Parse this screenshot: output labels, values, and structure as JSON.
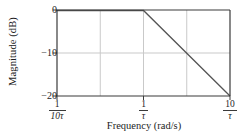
{
  "chart_data": {
    "type": "line",
    "title": "",
    "xlabel": "Frequency (rad/s)",
    "ylabel": "Magnitude (dB)",
    "xscale": "log",
    "x_tick_labels": [
      "1/(10τ)",
      "1/τ",
      "10/τ"
    ],
    "x_ticks_numerator": [
      "1",
      "1",
      "10"
    ],
    "x_ticks_denominator": [
      "10τ",
      "τ",
      "τ"
    ],
    "y_tick_labels": [
      "0",
      "−10",
      "−20"
    ],
    "y_ticks": [
      0,
      -10,
      -20
    ],
    "ylim": [
      -20,
      0
    ],
    "xlim_decades": [
      -1,
      1
    ],
    "grid": true,
    "gridlines_x_decades": [
      -1,
      -0.5,
      0,
      0.5,
      1
    ],
    "gridlines_y": [
      0,
      -10,
      -20
    ],
    "legend": "none",
    "series": [
      {
        "name": "First-order low-pass asymptotic magnitude",
        "x_decades": [
          -1,
          0,
          1
        ],
        "values": [
          0,
          0,
          -20
        ],
        "slope_after_corner_db_per_decade": -20,
        "corner_frequency_label": "1/τ",
        "color": "#4a4a4a"
      }
    ],
    "annotations": []
  },
  "axes": {
    "frame_color": "#3a3a3a",
    "grid_color": "#c9c9c9",
    "background": "#ffffff"
  },
  "labels": {
    "y_title": "Magnitude (dB)",
    "x_title": "Frequency (rad/s)",
    "y0": "0",
    "y1": "−10",
    "y2": "−20",
    "x0_num": "1",
    "x0_den": "10τ",
    "x1_num": "1",
    "x1_den": "τ",
    "x2_num": "10",
    "x2_den": "τ"
  }
}
